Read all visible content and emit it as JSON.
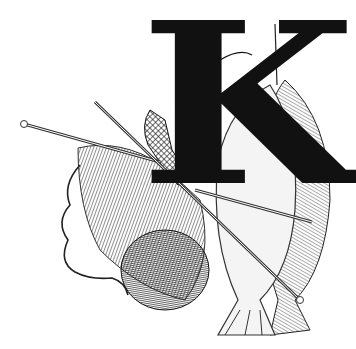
{
  "illustration": {
    "letter": "K",
    "colors": {
      "ink": "#111111",
      "paper": "#ffffff",
      "hatch": "#555555"
    },
    "elements": [
      "knitting-needle",
      "knitted-fabric",
      "yarn-strand",
      "yarn-ball",
      "hanging-fish",
      "figure-on-letter"
    ]
  }
}
